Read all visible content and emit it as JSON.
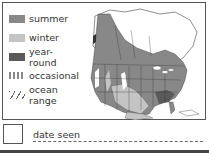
{
  "legend": {
    "items": [
      {
        "key": "summer",
        "label": "summer",
        "color": "#888888"
      },
      {
        "key": "winter",
        "label": "winter",
        "color": "#c4c4c4"
      },
      {
        "key": "year-round",
        "label": "year-round",
        "color": "#5a5a5a"
      },
      {
        "key": "occasional",
        "label": "occasional",
        "pattern": "dotted"
      },
      {
        "key": "ocean-range",
        "label": "ocean range",
        "pattern": "hatched"
      }
    ]
  },
  "map": {
    "region": "North America",
    "colors": {
      "land": "#ffffff",
      "summer": "#888888",
      "winter": "#c4c4c4",
      "year_round": "#5a5a5a",
      "border": "#333333"
    }
  },
  "record": {
    "date_label": "date seen"
  }
}
